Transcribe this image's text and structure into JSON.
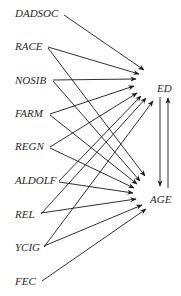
{
  "diagram": {
    "type": "path-diagram",
    "sources": [
      {
        "id": "DADSOC",
        "label": "DADSOC",
        "x": 14,
        "y": 13
      },
      {
        "id": "RACE",
        "label": "RACE",
        "x": 14,
        "y": 46
      },
      {
        "id": "NOSIB",
        "label": "NOSIB",
        "x": 14,
        "y": 80
      },
      {
        "id": "FARM",
        "label": "FARM",
        "x": 14,
        "y": 113
      },
      {
        "id": "REGN",
        "label": "REGN",
        "x": 14,
        "y": 146
      },
      {
        "id": "ALDOLF",
        "label": "ALDOLF",
        "x": 14,
        "y": 180
      },
      {
        "id": "REL",
        "label": "REL",
        "x": 14,
        "y": 214
      },
      {
        "id": "YCIG",
        "label": "YCIG",
        "x": 14,
        "y": 247
      },
      {
        "id": "FEC",
        "label": "FEC",
        "x": 14,
        "y": 281
      }
    ],
    "targets": [
      {
        "id": "ED",
        "label": "ED",
        "x": 158,
        "y": 88
      },
      {
        "id": "AGE",
        "label": "AGE",
        "x": 151,
        "y": 199
      }
    ],
    "edges": [
      {
        "from": "DADSOC",
        "to": "ED"
      },
      {
        "from": "RACE",
        "to": "ED"
      },
      {
        "from": "RACE",
        "to": "AGE"
      },
      {
        "from": "NOSIB",
        "to": "ED"
      },
      {
        "from": "NOSIB",
        "to": "AGE"
      },
      {
        "from": "FARM",
        "to": "ED"
      },
      {
        "from": "FARM",
        "to": "AGE"
      },
      {
        "from": "REGN",
        "to": "ED"
      },
      {
        "from": "REGN",
        "to": "AGE"
      },
      {
        "from": "ALDOLF",
        "to": "ED"
      },
      {
        "from": "ALDOLF",
        "to": "AGE"
      },
      {
        "from": "REL",
        "to": "ED"
      },
      {
        "from": "REL",
        "to": "AGE"
      },
      {
        "from": "YCIG",
        "to": "ED"
      },
      {
        "from": "YCIG",
        "to": "AGE"
      },
      {
        "from": "FEC",
        "to": "AGE"
      },
      {
        "from": "ED",
        "to": "AGE"
      },
      {
        "from": "AGE",
        "to": "ED"
      }
    ],
    "labels": {
      "DADSOC": "DADSOC",
      "RACE": "RACE",
      "NOSIB": "NOSIB",
      "FARM": "FARM",
      "REGN": "REGN",
      "ALDOLF": "ALDOLF",
      "REL": "REL",
      "YCIG": "YCIG",
      "FEC": "FEC",
      "ED": "ED",
      "AGE": "AGE"
    },
    "line_color": "#1a1a1a",
    "text_color": "#2a2a2a"
  }
}
